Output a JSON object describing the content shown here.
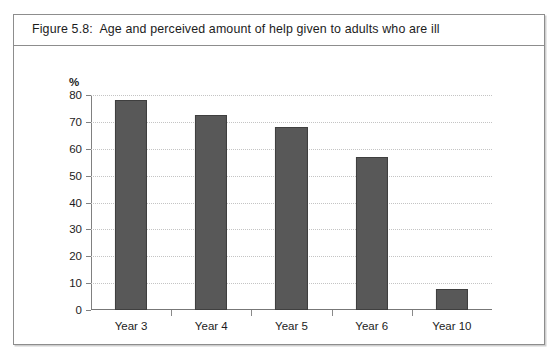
{
  "figure": {
    "caption": "Figure 5.8:  Age and perceived amount of help given to adults who are ill"
  },
  "chart_data": {
    "type": "bar",
    "title": "Figure 5.8:  Age and perceived amount of help given to adults who are ill",
    "categories": [
      "Year 3",
      "Year 4",
      "Year 5",
      "Year 6",
      "Year 10"
    ],
    "values": [
      78,
      72.5,
      68,
      57,
      8
    ],
    "xlabel": "",
    "ylabel": "%",
    "ylim": [
      0,
      80
    ],
    "yticks": [
      0,
      10,
      20,
      30,
      40,
      50,
      60,
      70,
      80
    ],
    "ytick_labels": [
      "0",
      "10",
      "20",
      "30",
      "40",
      "50",
      "60",
      "70",
      "80"
    ],
    "grid": true,
    "grid_axis": "y",
    "grid_style": "dotted",
    "legend": false,
    "series": [
      {
        "name": "Perceived amount of help",
        "values": [
          78,
          72.5,
          68,
          57,
          8
        ]
      }
    ]
  },
  "style": {
    "bar_fill": "#585858",
    "bar_stroke": "#3f3f3f",
    "grid_color": "#c4c4c4",
    "axis_color": "#808080",
    "frame_border": "#8d8d8d",
    "text_color": "#1c1c1c",
    "background": "#ffffff"
  }
}
